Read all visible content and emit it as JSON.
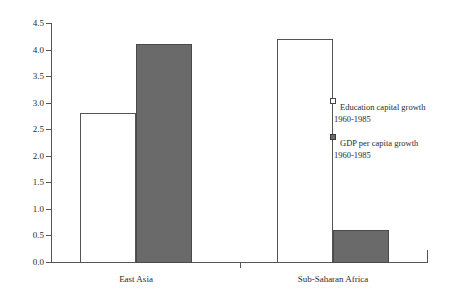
{
  "chart_data": {
    "type": "bar",
    "title": "",
    "subtitle": "",
    "xlabel": "",
    "ylabel": "",
    "ylim": [
      0.0,
      4.5
    ],
    "ytick_labels": [
      "0.0",
      "0.5",
      "1.0",
      "1.5",
      "2.0",
      "2.5",
      "3.0",
      "3.5",
      "4.0",
      "4.5"
    ],
    "ytick_values": [
      0.0,
      0.5,
      1.0,
      1.5,
      2.0,
      2.5,
      3.0,
      3.5,
      4.0,
      4.5
    ],
    "grid": false,
    "legend_position": "right",
    "categories": [
      "East Asia",
      "Sub-Saharan Africa"
    ],
    "series": [
      {
        "name": "Education capital growth 1960-1985",
        "style": "open",
        "values": [
          2.8,
          4.2
        ]
      },
      {
        "name": "GDP per capita growth 1960-1985",
        "style": "filled",
        "values": [
          4.1,
          0.6
        ]
      }
    ]
  },
  "legend": {
    "entries": [
      {
        "marker": "open-square-icon",
        "line1": "Education capital growth",
        "line2": "1960-1985"
      },
      {
        "marker": "filled-square-icon",
        "line1": "GDP per capita growth",
        "line2": "1960-1985"
      }
    ]
  },
  "colors": {
    "bar_fill_gray": "#6a6a6a",
    "bar_outline": "#555555",
    "axis": "#555555",
    "text": "#2b2b2b",
    "background": "#ffffff"
  }
}
